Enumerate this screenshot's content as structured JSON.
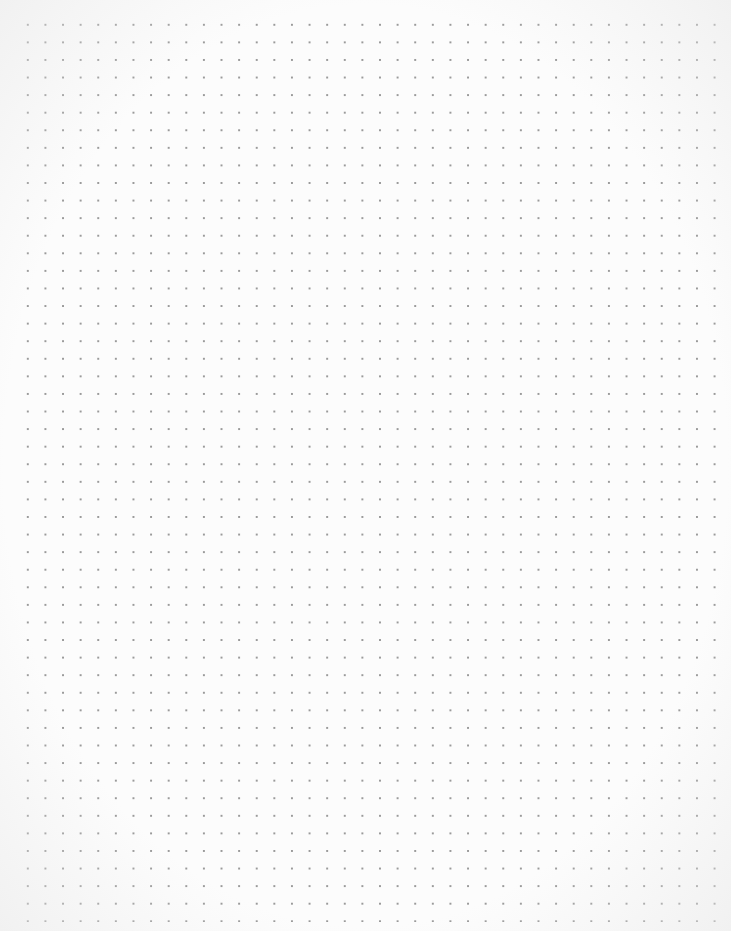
{
  "paper": {
    "type": "dot-grid",
    "background_color": "#fcfcfc",
    "dot_color": "#9a9a9a",
    "dot_spacing_px": 17.6,
    "columns": 40,
    "rows": 51
  }
}
